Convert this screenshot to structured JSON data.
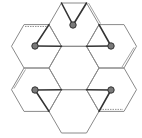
{
  "diagram": {
    "title": "",
    "colors": {
      "hex_edge": "#8a8a8a",
      "bond": "#333333",
      "dot_fill": "#7a7a7a",
      "background": "#ffffff"
    },
    "hexagons": [
      {
        "id": "top",
        "center": [
          74,
          24.6
        ]
      },
      {
        "id": "upper-left",
        "center": [
          36.5,
          46.3
        ]
      },
      {
        "id": "upper-right",
        "center": [
          111.5,
          46.3
        ]
      },
      {
        "id": "center",
        "center": [
          74,
          68
        ]
      },
      {
        "id": "lower-left",
        "center": [
          36.5,
          89.7
        ]
      },
      {
        "id": "lower-right",
        "center": [
          111.5,
          89.7
        ]
      },
      {
        "id": "bottom",
        "center": [
          74,
          111.4
        ]
      }
    ],
    "nodes": [
      {
        "id": "n-top",
        "pos": [
          73,
          25
        ]
      },
      {
        "id": "n-upper-left",
        "pos": [
          35,
          46
        ]
      },
      {
        "id": "n-upper-right",
        "pos": [
          111,
          46
        ]
      },
      {
        "id": "n-lower-left",
        "pos": [
          35,
          90
        ]
      },
      {
        "id": "n-lower-right",
        "pos": [
          111,
          90
        ]
      }
    ],
    "labels": []
  }
}
